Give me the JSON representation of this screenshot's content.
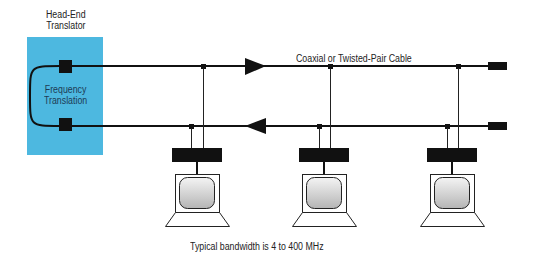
{
  "diagram": {
    "headend": {
      "title_line1": "Head-End",
      "title_line2": "Translator",
      "inner_line1": "Frequency",
      "inner_line2": "Translation",
      "box_color": "#4DB8E0"
    },
    "cable_label": "Coaxial or Twisted-Pair Cable",
    "footer_note": "Typical bandwidth is 4 to 400 MHz",
    "forward_direction": "right",
    "return_direction": "left",
    "terminals": [
      {
        "name": "terminal-1"
      },
      {
        "name": "terminal-2"
      },
      {
        "name": "terminal-3"
      }
    ],
    "colors": {
      "line": "#1a1a1a",
      "text": "#222222",
      "screen_light": "#f2f2f2",
      "screen_dark": "#b8b8b8"
    }
  }
}
